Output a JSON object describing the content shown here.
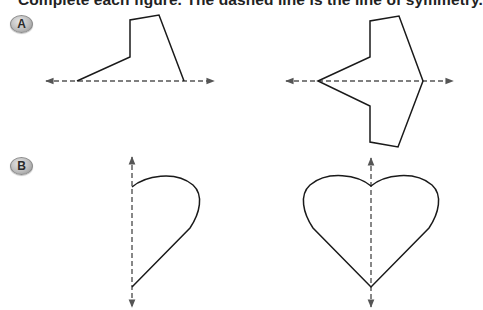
{
  "instructions": "Complete each figure. The dashed line is the line of symmetry.",
  "problems": [
    {
      "label": "A",
      "given_figure": "half polygon above horizontal line of symmetry",
      "completed_figure": "full polygon symmetric about horizontal line"
    },
    {
      "label": "B",
      "given_figure": "half heart to right of vertical line of symmetry",
      "completed_figure": "full heart symmetric about vertical line"
    }
  ],
  "colors": {
    "stroke": "#1a1a1a",
    "axis": "#555555",
    "badge": "#b8b8b8",
    "text": "#222222"
  }
}
